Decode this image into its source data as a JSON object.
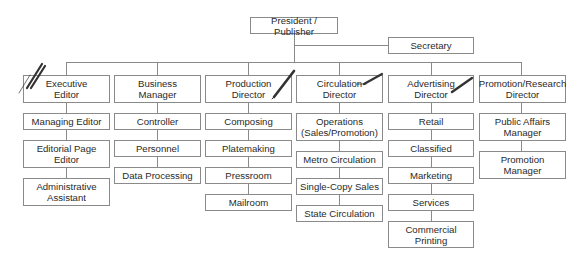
{
  "chart": {
    "top": {
      "label": "President / Publisher"
    },
    "staff": {
      "label": "Secretary"
    },
    "columns": [
      {
        "head": "Executive\nEditor",
        "items": [
          "Managing Editor",
          "Editorial Page\nEditor",
          "Administrative\nAssistant"
        ]
      },
      {
        "head": "Business\nManager",
        "items": [
          "Controller",
          "Personnel",
          "Data Processing"
        ]
      },
      {
        "head": "Production\nDirector",
        "items": [
          "Composing",
          "Platemaking",
          "Pressroom",
          "Mailroom"
        ]
      },
      {
        "head": "Circulation\nDirector",
        "items": [
          "Operations\n(Sales/Promotion)",
          "Metro Circulation",
          "Single-Copy Sales",
          "State Circulation"
        ]
      },
      {
        "head": "Advertising\nDirector",
        "items": [
          "Retail",
          "Classified",
          "Marketing",
          "Services",
          "Commercial\nPrinting"
        ]
      },
      {
        "head": "Promotion/Research\nDirector",
        "items": [
          "Public Affairs\nManager",
          "Promotion\nManager"
        ]
      }
    ]
  },
  "annotations": [
    "pen-mark-executive-editor",
    "pen-mark-production-director",
    "pen-mark-circulation-director",
    "pen-mark-advertising-director"
  ],
  "colors": {
    "line": "#8a8a8a",
    "text": "#2a2a2a",
    "pen": "#333333"
  }
}
